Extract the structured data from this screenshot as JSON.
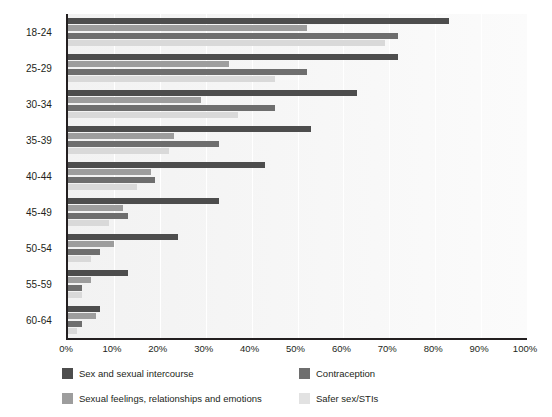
{
  "chart_data": {
    "type": "bar",
    "orientation": "horizontal",
    "title": "",
    "subtitle": "",
    "xlabel": "",
    "ylabel": "",
    "xlim": [
      0,
      100
    ],
    "grid": true,
    "legend_position": "bottom",
    "categories": [
      "18-24",
      "25-29",
      "30-34",
      "35-39",
      "40-44",
      "45-49",
      "50-54",
      "55-59",
      "60-64"
    ],
    "tick_labels": [
      "0%",
      "10%",
      "20%",
      "30%",
      "40%",
      "50%",
      "60%",
      "70%",
      "80%",
      "90%",
      "100%"
    ],
    "tick_values": [
      0,
      10,
      20,
      30,
      40,
      50,
      60,
      70,
      80,
      90,
      100
    ],
    "series": [
      {
        "name": "Sex and sexual intercourse",
        "color": "#4d4d4d",
        "values": [
          83,
          72,
          63,
          53,
          43,
          33,
          24,
          13,
          7
        ]
      },
      {
        "name": "Sexual feelings, relationships and emotions",
        "color": "#9d9d9d",
        "values": [
          52,
          35,
          29,
          23,
          18,
          12,
          10,
          5,
          6
        ]
      },
      {
        "name": "Contraception",
        "color": "#6e6e6e",
        "values": [
          72,
          52,
          45,
          33,
          19,
          13,
          7,
          3,
          3
        ]
      },
      {
        "name": "Safer sex/STIs",
        "color": "#d9d9d9",
        "values": [
          69,
          45,
          37,
          22,
          15,
          9,
          5,
          3,
          2
        ]
      }
    ]
  },
  "legend": {
    "items": [
      {
        "label": "Sex and sexual intercourse",
        "color": "#4d4d4d"
      },
      {
        "label": "Contraception",
        "color": "#6e6e6e"
      },
      {
        "label": "Sexual feelings, relationships and emotions",
        "color": "#9d9d9d"
      },
      {
        "label": "Safer sex/STIs",
        "color": "#e2e2e2"
      }
    ]
  }
}
